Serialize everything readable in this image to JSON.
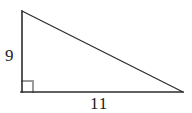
{
  "figure": {
    "type": "right-triangle-diagram",
    "background_color": "#ffffff",
    "stroke_color": "#2b2b2b",
    "right_angle_marker_color": "#9a9a9a",
    "label_color": "#222222",
    "canvas": {
      "width": 192,
      "height": 113
    },
    "vertices": {
      "apex": {
        "x": 22,
        "y": 11
      },
      "right_angle": {
        "x": 22,
        "y": 92
      },
      "base_right": {
        "x": 183,
        "y": 92
      }
    },
    "right_angle_marker": {
      "name": "right-angle-square",
      "x": 22,
      "y": 81,
      "size": 11
    },
    "labels": {
      "vertical_leg": "9",
      "horizontal_leg": "11"
    }
  }
}
